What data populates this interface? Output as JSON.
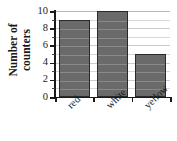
{
  "chart_data": {
    "type": "bar",
    "title": "",
    "subtitle": "",
    "xlabel": "",
    "ylabel": "Number of counters",
    "ylabel_lines": [
      "Number of",
      "counters"
    ],
    "categories": [
      "red",
      "white",
      "yellow"
    ],
    "values": [
      9,
      10,
      5
    ],
    "ylim": [
      0,
      10
    ],
    "ytick_labels": [
      "0",
      "2",
      "4",
      "6",
      "8",
      "10"
    ],
    "ytick_values": [
      0,
      2,
      4,
      6,
      8,
      10
    ],
    "minor_tick_step": 1,
    "grid": true,
    "grid_axis": "y",
    "legend": null,
    "annotations": [],
    "colors": {
      "bar_fill": "#6a6a6a",
      "bar_edge": "#2a2a2a",
      "gridline": "#d8d8d8",
      "axis": "#1a1a1a",
      "background": "#ffffff",
      "text": "#1a1a1a"
    },
    "xlabel_rotation_deg": -45
  }
}
